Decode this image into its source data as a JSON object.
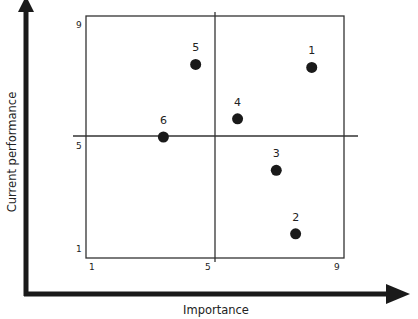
{
  "chart_data": {
    "type": "scatter",
    "title": "",
    "xlabel": "Importance",
    "ylabel": "Current performance",
    "xlim": [
      1,
      9
    ],
    "ylim": [
      1,
      9
    ],
    "x_ticks": [
      "1",
      "5",
      "9"
    ],
    "y_ticks": [
      "1",
      "5",
      "9"
    ],
    "grid": false,
    "quadrant_dividers": {
      "x": 5,
      "y": 5
    },
    "legend": null,
    "points": [
      {
        "label": "1",
        "x": 8.0,
        "y": 7.3
      },
      {
        "label": "2",
        "x": 7.5,
        "y": 1.8
      },
      {
        "label": "3",
        "x": 6.9,
        "y": 3.9
      },
      {
        "label": "4",
        "x": 5.7,
        "y": 5.6
      },
      {
        "label": "5",
        "x": 4.4,
        "y": 7.4
      },
      {
        "label": "6",
        "x": 3.4,
        "y": 5.0
      }
    ]
  },
  "colors": {
    "ink": "#1a1a1a",
    "background": "#ffffff"
  }
}
